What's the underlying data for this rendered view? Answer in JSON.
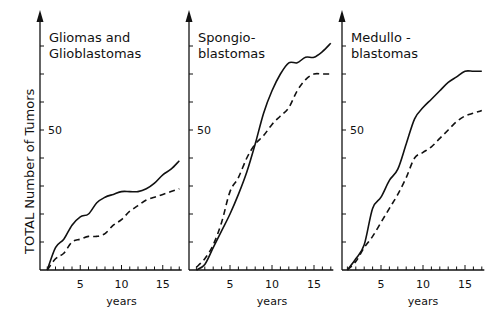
{
  "figure": {
    "ylabel": "TOTAL Number of Tumors",
    "xlabel": "years"
  },
  "chart_data": [
    {
      "type": "line",
      "title": "Gliomas and Glioblastomas",
      "title_lines": [
        "Gliomas and",
        "Glioblastomas"
      ],
      "xlabel": "years",
      "ylabel": "TOTAL Number of Tumors",
      "xticks": [
        5,
        10,
        15
      ],
      "yticks": [
        50
      ],
      "xlim": [
        0,
        17
      ],
      "ylim": [
        0,
        85
      ],
      "grid": false,
      "x": [
        1,
        2,
        3,
        4,
        5,
        6,
        7,
        8,
        9,
        10,
        11,
        12,
        13,
        14,
        15,
        16,
        17
      ],
      "series": [
        {
          "name": "solid",
          "style": "solid",
          "values": [
            0,
            8,
            11,
            16,
            19,
            20,
            24,
            26,
            27,
            28,
            28,
            28,
            29,
            31,
            34,
            36,
            39
          ]
        },
        {
          "name": "dashed",
          "style": "dashed",
          "values": [
            0,
            4,
            6,
            10,
            11,
            12,
            12,
            13,
            16,
            18,
            21,
            23,
            25,
            26,
            27,
            28,
            29
          ]
        }
      ]
    },
    {
      "type": "line",
      "title": "Spongioblastomas",
      "title_lines": [
        "Spongio-",
        "blastomas"
      ],
      "xlabel": "years",
      "xticks": [
        5,
        10,
        15
      ],
      "yticks": [
        50
      ],
      "xlim": [
        0,
        17
      ],
      "ylim": [
        0,
        85
      ],
      "grid": false,
      "x": [
        1,
        2,
        3,
        4,
        5,
        6,
        7,
        8,
        9,
        10,
        11,
        12,
        13,
        14,
        15,
        16,
        17
      ],
      "series": [
        {
          "name": "solid",
          "style": "solid",
          "values": [
            0,
            2,
            8,
            14,
            20,
            27,
            35,
            45,
            56,
            64,
            70,
            74,
            74,
            76,
            76,
            78,
            81
          ]
        },
        {
          "name": "dashed",
          "style": "dashed",
          "values": [
            1,
            4,
            9,
            17,
            28,
            33,
            40,
            45,
            48,
            52,
            55,
            58,
            64,
            68,
            70,
            70,
            70
          ]
        }
      ]
    },
    {
      "type": "line",
      "title": "Medulloblastomas",
      "title_lines": [
        "Medullo -",
        "blastomas"
      ],
      "xlabel": "years",
      "xticks": [
        5,
        10,
        15
      ],
      "yticks": [
        50
      ],
      "xlim": [
        0,
        17
      ],
      "ylim": [
        0,
        85
      ],
      "grid": false,
      "x": [
        1,
        2,
        3,
        4,
        5,
        6,
        7,
        8,
        9,
        10,
        11,
        12,
        13,
        14,
        15,
        16,
        17
      ],
      "series": [
        {
          "name": "solid",
          "style": "solid",
          "values": [
            0,
            4,
            9,
            22,
            26,
            32,
            36,
            45,
            54,
            58,
            61,
            64,
            67,
            69,
            71,
            71,
            71
          ]
        },
        {
          "name": "dashed",
          "style": "dashed",
          "values": [
            0,
            3,
            8,
            12,
            17,
            22,
            27,
            33,
            40,
            42,
            44,
            47,
            50,
            53,
            55,
            56,
            57
          ]
        }
      ]
    }
  ],
  "colors": {
    "line": "#111111",
    "background": "#ffffff"
  }
}
